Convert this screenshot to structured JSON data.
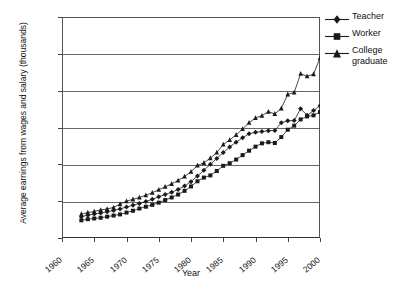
{
  "chart_data": {
    "type": "line",
    "title": "",
    "xlabel": "Year",
    "ylabel": "Average earnings from wages and salary (thousands)",
    "xlim": [
      1960,
      2000
    ],
    "ylim": [
      0,
      60
    ],
    "ytick_step": 10,
    "xtick_step": 5,
    "xticks": [
      "1960",
      "1965",
      "1970",
      "1975",
      "1980",
      "1985",
      "1990",
      "1995",
      "2000"
    ],
    "yticks": [
      "0",
      "10",
      "20",
      "30",
      "40",
      "50",
      "60"
    ],
    "grid": "horizontal",
    "legend_position": "top-right",
    "x": [
      1963,
      1964,
      1965,
      1966,
      1967,
      1968,
      1969,
      1970,
      1971,
      1972,
      1973,
      1974,
      1975,
      1976,
      1977,
      1978,
      1979,
      1980,
      1981,
      1982,
      1983,
      1984,
      1985,
      1986,
      1987,
      1988,
      1989,
      1990,
      1991,
      1992,
      1993,
      1994,
      1995,
      1996,
      1997,
      1998,
      1999,
      2000
    ],
    "series": [
      {
        "name": "Teacher",
        "marker": "diamond",
        "values": [
          5.8,
          6.2,
          6.5,
          6.8,
          7.1,
          7.5,
          7.9,
          8.4,
          8.9,
          9.4,
          9.9,
          10.5,
          11.2,
          11.8,
          12.4,
          13.2,
          14.1,
          15.3,
          16.8,
          18.4,
          20.0,
          21.6,
          23.2,
          24.7,
          26.0,
          27.2,
          28.3,
          28.7,
          28.9,
          29.1,
          29.2,
          31.3,
          31.8,
          31.9,
          35.1,
          33.3,
          34.6,
          35.9
        ]
      },
      {
        "name": "Worker",
        "marker": "square",
        "values": [
          4.8,
          5.1,
          5.3,
          5.5,
          5.8,
          6.1,
          6.4,
          6.9,
          7.4,
          8.0,
          8.5,
          9.0,
          9.6,
          10.3,
          11.0,
          11.8,
          12.8,
          14.0,
          15.4,
          16.4,
          17.0,
          18.2,
          19.6,
          20.3,
          21.3,
          22.5,
          23.7,
          24.8,
          25.7,
          26.0,
          25.8,
          27.4,
          29.4,
          30.5,
          32.2,
          33.0,
          33.3,
          34.2
        ]
      },
      {
        "name": "College graduate",
        "marker": "triangle",
        "values": [
          6.5,
          6.9,
          7.2,
          7.6,
          7.9,
          8.3,
          9.2,
          10.0,
          10.5,
          11.0,
          11.6,
          12.3,
          13.1,
          13.9,
          14.7,
          15.6,
          16.7,
          18.0,
          19.7,
          20.4,
          21.7,
          23.2,
          25.4,
          26.6,
          28.0,
          29.6,
          31.3,
          32.6,
          33.2,
          34.3,
          33.7,
          35.2,
          39.0,
          39.5,
          44.6,
          43.9,
          44.5,
          48.9
        ]
      }
    ]
  },
  "legend": {
    "items": [
      {
        "label_line1": "Teacher",
        "label_line2": ""
      },
      {
        "label_line1": "Worker",
        "label_line2": ""
      },
      {
        "label_line1": "College",
        "label_line2": "graduate"
      }
    ]
  },
  "colors": {
    "series": "#1a1a1a",
    "grid": "#666666",
    "axis": "#444444",
    "background": "#ffffff"
  }
}
